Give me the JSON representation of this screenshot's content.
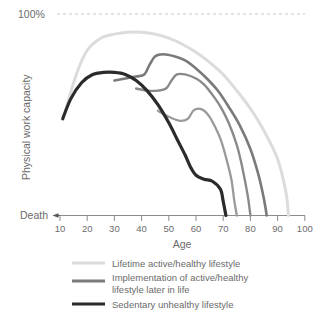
{
  "chart_data": {
    "type": "line",
    "title": "",
    "xlabel": "Age",
    "ylabel": "Physical work capacity",
    "xlim": [
      5,
      100
    ],
    "ylim": [
      0,
      100
    ],
    "xticks": [
      10,
      20,
      30,
      40,
      50,
      60,
      70,
      80,
      90,
      100
    ],
    "xtick_labels": [
      "10",
      "20",
      "30",
      "40",
      "50",
      "60",
      "70",
      "80",
      "90",
      "100"
    ],
    "ytop_label": "100%",
    "ybottom_label": "Death",
    "grid": false,
    "reference_lines": [
      {
        "name": "100% capacity",
        "axis": "y",
        "value": 100,
        "style": "dashed",
        "color": "#c9c9c9"
      }
    ],
    "legend_position": "bottom",
    "series": [
      {
        "name": "Lifetime active/healthy lifestyle",
        "color": "#dcdcdc",
        "width": 3.0,
        "x": [
          12,
          16,
          20,
          25,
          30,
          35,
          40,
          45,
          50,
          55,
          60,
          65,
          70,
          75,
          80,
          85,
          90,
          93,
          94
        ],
        "y": [
          52,
          70,
          82,
          88,
          90,
          91,
          91,
          90,
          88,
          85,
          81,
          76,
          70,
          62,
          53,
          42,
          28,
          12,
          0
        ]
      },
      {
        "name": "Implementation of active/healthy lifestyle later in life (from ~42)",
        "color": "#7a7a7a",
        "width": 2.6,
        "x": [
          30,
          34,
          38,
          41,
          43,
          45,
          48,
          52,
          56,
          60,
          64,
          68,
          72,
          76,
          80,
          83,
          85,
          86
        ],
        "y": [
          67,
          68,
          69,
          70,
          75,
          79,
          80,
          79,
          77,
          73,
          68,
          62,
          54,
          45,
          33,
          20,
          8,
          0
        ]
      },
      {
        "name": "Implementation of active/healthy lifestyle later in life (from ~50)",
        "color": "#8a8a8a",
        "width": 2.4,
        "x": [
          38,
          42,
          46,
          49,
          51,
          53,
          56,
          60,
          63,
          66,
          69,
          72,
          75,
          77,
          79,
          80
        ],
        "y": [
          63,
          62,
          62,
          63,
          67,
          70,
          70,
          68,
          65,
          60,
          54,
          46,
          35,
          24,
          10,
          0
        ]
      },
      {
        "name": "Implementation of active/healthy lifestyle later in life (from ~58)",
        "color": "#9a9a9a",
        "width": 2.3,
        "x": [
          46,
          50,
          54,
          57,
          59,
          61,
          63,
          65,
          67,
          69,
          71,
          73,
          74,
          75
        ],
        "y": [
          52,
          49,
          47,
          48,
          52,
          53,
          52,
          49,
          44,
          38,
          29,
          18,
          8,
          0
        ]
      },
      {
        "name": "Sedentary unhealthy lifestyle",
        "color": "#2b2b2b",
        "width": 3.2,
        "x": [
          11,
          14,
          18,
          22,
          26,
          30,
          34,
          38,
          42,
          46,
          50,
          53,
          56,
          58,
          60,
          63,
          66,
          69,
          70,
          71
        ],
        "y": [
          48,
          58,
          66,
          70,
          71,
          71,
          70,
          67,
          62,
          55,
          46,
          38,
          30,
          24,
          20,
          18,
          17,
          13,
          7,
          0
        ]
      }
    ],
    "annotations": []
  },
  "axes": {
    "x_title": "Age",
    "y_title": "Physical work capacity",
    "y_top_label": "100%",
    "y_bottom_label": "Death",
    "x_tick_labels": [
      "10",
      "20",
      "30",
      "40",
      "50",
      "60",
      "70",
      "80",
      "90",
      "100"
    ]
  },
  "legend": {
    "items": [
      {
        "swatch_color": "#dcdcdc",
        "line1": "Lifetime active/healthy lifestyle",
        "line2": ""
      },
      {
        "swatch_color": "#7a7a7a",
        "line1": "Implementation of active/healthy",
        "line2": "lifestyle later in life"
      },
      {
        "swatch_color": "#2b2b2b",
        "line1": "Sedentary unhealthy lifestyle",
        "line2": ""
      }
    ]
  },
  "colors": {
    "background": "#ffffff",
    "text": "#6b6b6b",
    "axis": "#8c8c8c",
    "dashed_reference": "#c9c9c9"
  }
}
